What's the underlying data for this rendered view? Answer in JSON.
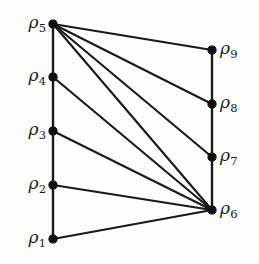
{
  "diagram": {
    "background_color": "#fdfdfc",
    "line_color": "#191919",
    "node_color": "#111111",
    "node_symbol": "ρ",
    "nodes": [
      {
        "id": "rho1",
        "symbol": "ρ",
        "subscript": "1",
        "x": 53,
        "y": 239,
        "label_side": "left",
        "label_x": 46,
        "label_y": 239
      },
      {
        "id": "rho2",
        "symbol": "ρ",
        "subscript": "2",
        "x": 53,
        "y": 185,
        "label_side": "left",
        "label_x": 46,
        "label_y": 185
      },
      {
        "id": "rho3",
        "symbol": "ρ",
        "subscript": "3",
        "x": 53,
        "y": 131,
        "label_side": "left",
        "label_x": 46,
        "label_y": 131
      },
      {
        "id": "rho4",
        "symbol": "ρ",
        "subscript": "4",
        "x": 53,
        "y": 77,
        "label_side": "left",
        "label_x": 46,
        "label_y": 77
      },
      {
        "id": "rho5",
        "symbol": "ρ",
        "subscript": "5",
        "x": 53,
        "y": 24,
        "label_side": "left",
        "label_x": 46,
        "label_y": 24
      },
      {
        "id": "rho6",
        "symbol": "ρ",
        "subscript": "6",
        "x": 212,
        "y": 210,
        "label_side": "right",
        "label_x": 220,
        "label_y": 210
      },
      {
        "id": "rho7",
        "symbol": "ρ",
        "subscript": "7",
        "x": 212,
        "y": 157,
        "label_side": "right",
        "label_x": 220,
        "label_y": 157
      },
      {
        "id": "rho8",
        "symbol": "ρ",
        "subscript": "8",
        "x": 212,
        "y": 104,
        "label_side": "right",
        "label_x": 220,
        "label_y": 104
      },
      {
        "id": "rho9",
        "symbol": "ρ",
        "subscript": "9",
        "x": 212,
        "y": 50,
        "label_side": "right",
        "label_x": 220,
        "label_y": 50
      }
    ],
    "edges": [
      {
        "from": "rho1",
        "to": "rho2",
        "kind": "spine"
      },
      {
        "from": "rho2",
        "to": "rho3",
        "kind": "spine"
      },
      {
        "from": "rho3",
        "to": "rho4",
        "kind": "spine"
      },
      {
        "from": "rho4",
        "to": "rho5",
        "kind": "spine"
      },
      {
        "from": "rho6",
        "to": "rho7",
        "kind": "spine"
      },
      {
        "from": "rho7",
        "to": "rho8",
        "kind": "spine"
      },
      {
        "from": "rho8",
        "to": "rho9",
        "kind": "spine"
      },
      {
        "from": "rho5",
        "to": "rho9",
        "kind": "cross"
      },
      {
        "from": "rho5",
        "to": "rho8",
        "kind": "cross"
      },
      {
        "from": "rho5",
        "to": "rho7",
        "kind": "cross"
      },
      {
        "from": "rho5",
        "to": "rho6",
        "kind": "cross"
      },
      {
        "from": "rho4",
        "to": "rho6",
        "kind": "cross"
      },
      {
        "from": "rho3",
        "to": "rho6",
        "kind": "cross"
      },
      {
        "from": "rho2",
        "to": "rho6",
        "kind": "cross"
      },
      {
        "from": "rho1",
        "to": "rho6",
        "kind": "cross"
      }
    ],
    "node_radius": 4.1
  }
}
